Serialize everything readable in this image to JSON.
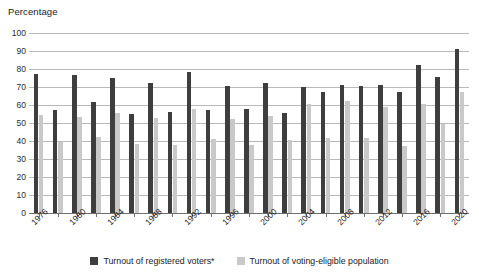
{
  "axis": {
    "y_title": "Percentage",
    "y_ticks": [
      0,
      10,
      20,
      30,
      40,
      50,
      60,
      70,
      80,
      90,
      100
    ]
  },
  "legend": {
    "items": [
      {
        "label": "Turnout of registered voters*",
        "color": "#3e3e3e",
        "swatch": "dark"
      },
      {
        "label": "Turnout of voting-eligible population",
        "color": "#c9c9c9",
        "swatch": "light"
      }
    ]
  },
  "chart_data": {
    "type": "bar",
    "title": "",
    "subtitle": "",
    "xlabel": "",
    "ylabel": "Percentage",
    "ylim": [
      0,
      100
    ],
    "ytick_step": 10,
    "grid": true,
    "legend_position": "bottom-center",
    "categories": [
      "1976",
      "1978",
      "1980",
      "1982",
      "1984",
      "1986",
      "1988",
      "1990",
      "1992",
      "1994",
      "1996",
      "1998",
      "2000",
      "2002",
      "2004",
      "2006",
      "2008",
      "2010",
      "2012",
      "2014",
      "2016",
      "2018",
      "2020"
    ],
    "tick_labels": [
      "1976",
      "1980",
      "1984",
      "1988",
      "1992",
      "1996",
      "2000",
      "2004",
      "2008",
      "2012",
      "2016",
      "2020"
    ],
    "series": [
      {
        "name": "Turnout of registered voters*",
        "color": "#3e3e3e",
        "values": [
          77.5,
          57.0,
          76.5,
          61.5,
          75.0,
          55.0,
          72.5,
          56.0,
          78.5,
          57.5,
          70.5,
          58.0,
          72.5,
          55.5,
          70.0,
          67.0,
          71.0,
          70.5,
          71.0,
          67.0,
          82.5,
          75.5,
          91.0
        ]
      },
      {
        "name": "Turnout of voting-eligible population",
        "color": "#c9c9c9",
        "values": [
          54.5,
          39.5,
          53.5,
          42.0,
          55.5,
          38.5,
          53.0,
          38.0,
          58.0,
          41.0,
          52.0,
          38.0,
          54.0,
          40.5,
          60.5,
          41.5,
          62.0,
          41.5,
          59.0,
          37.0,
          60.5,
          49.5,
          67.0
        ]
      }
    ]
  }
}
